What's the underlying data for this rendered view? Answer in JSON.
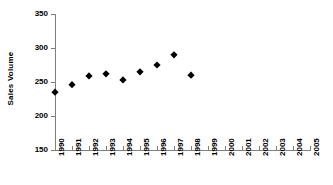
{
  "chart_data": {
    "type": "scatter",
    "title": "",
    "xlabel": "",
    "ylabel": "Sales Volume",
    "categories": [
      "1990",
      "1991",
      "1992",
      "1993",
      "1994",
      "1995",
      "1996",
      "1997",
      "1998",
      "1999",
      "2000",
      "2001",
      "2002",
      "2003",
      "2004",
      "2005"
    ],
    "values": [
      235,
      246,
      259,
      262,
      253,
      265,
      275,
      290,
      260,
      null,
      null,
      null,
      null,
      null,
      null,
      null
    ],
    "ylim": [
      150,
      350
    ],
    "ytick_labels": [
      "150",
      "200",
      "250",
      "300",
      "350"
    ],
    "yticks": [
      150,
      200,
      250,
      300,
      350
    ],
    "grid": false,
    "legend": false,
    "marker": "diamond",
    "marker_color": "#000000",
    "axis_color": "#808080"
  },
  "axes": {
    "y_title": "Sales Volume"
  }
}
